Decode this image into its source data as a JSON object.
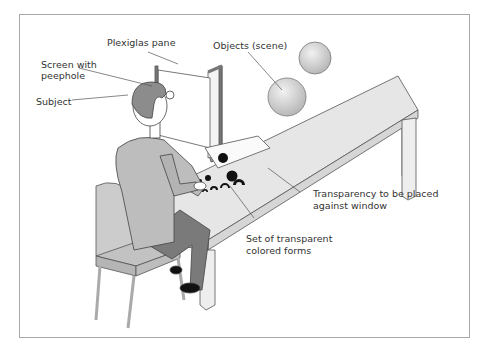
{
  "figure": {
    "type": "illustration",
    "labels": {
      "plexiglas_pane": "Plexiglas pane",
      "objects_scene": "Objects (scene)",
      "screen_line1": "Screen with",
      "screen_line2": "peephole",
      "subject": "Subject",
      "transparency_line1": "Transparency to be placed",
      "transparency_line2": "against window",
      "forms_line1": "Set of transparent",
      "forms_line2": "colored forms"
    },
    "colors": {
      "frame": "#a8a8a8",
      "table_top": "#e6e6e6",
      "table_edge": "#d0d0d0",
      "shirt": "#bdbdbd",
      "trousers": "#7a7a7a",
      "hair": "#8c8c8c",
      "chair": "#c8c8c8",
      "sphere": "#cfcfcf",
      "forms": "#111111",
      "stroke": "#444444"
    }
  }
}
